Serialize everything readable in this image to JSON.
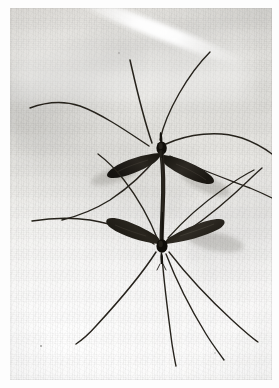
{
  "image": {
    "kind": "photograph",
    "subject": "mating pair of crane flies",
    "scientific_family": "Tipulidae",
    "background_description": "pale woven white cloth with soft folds",
    "orientation": "portrait",
    "width_px": 279,
    "height_px": 388,
    "print_margin_px": {
      "left": 10,
      "top": 8,
      "right": 7,
      "bottom": 8
    },
    "has_visible_text": false,
    "caption": ""
  },
  "palette": {
    "paper_white": "#fdfdfd",
    "cloth_light": "#f6f5f4",
    "cloth_mid": "#e7e6e2",
    "cloth_shadow": "#dad8d4",
    "insect_body": "#17150f",
    "insect_wing": "#2b2722",
    "insect_wing_edge": "#4a453c",
    "leg_dark": "#25221c",
    "highlight": "#ffffff"
  },
  "subjects": [
    {
      "name": "upper-crane-fly",
      "thorax": {
        "x": 152,
        "y": 143
      },
      "facing": "up",
      "wings": [
        {
          "side": "left",
          "tip": {
            "x": 103,
            "y": 163
          },
          "length_px": 52,
          "angle_deg": 198
        },
        {
          "side": "right",
          "tip": {
            "x": 201,
            "y": 172
          },
          "length_px": 52,
          "angle_deg": 27
        }
      ],
      "leg_count_visible": 6
    },
    {
      "name": "lower-crane-fly",
      "thorax": {
        "x": 152,
        "y": 240
      },
      "facing": "down",
      "wings": [
        {
          "side": "left",
          "tip": {
            "x": 100,
            "y": 220
          },
          "length_px": 55,
          "angle_deg": 160
        },
        {
          "side": "right",
          "tip": {
            "x": 212,
            "y": 228
          },
          "length_px": 58,
          "angle_deg": 12
        }
      ],
      "leg_count_visible": 6
    }
  ],
  "connection": {
    "name": "joined-abdomens",
    "from": {
      "x": 152,
      "y": 150
    },
    "to": {
      "x": 152,
      "y": 236
    },
    "description": "abdomens joined end to end forming a vertical dark bar"
  },
  "specks": [
    {
      "x": 40,
      "y": 345,
      "r": 1.4
    },
    {
      "x": 214,
      "y": 352,
      "r": 1.0
    },
    {
      "x": 118,
      "y": 52,
      "r": 0.9
    }
  ]
}
